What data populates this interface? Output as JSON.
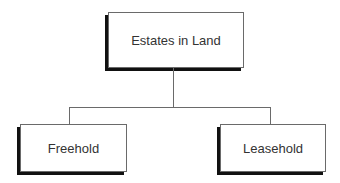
{
  "diagram": {
    "type": "hierarchy",
    "root": {
      "label": "Estates in Land"
    },
    "children": [
      {
        "label": "Freehold"
      },
      {
        "label": "Leasehold"
      }
    ]
  }
}
